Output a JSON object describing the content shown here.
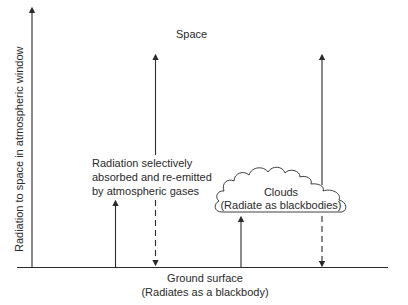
{
  "diagram": {
    "labels": {
      "space": "Space",
      "left_axis": "Radiation to space in atmospheric window",
      "gases_line1": "Radiation selectively",
      "gases_line2": "absorbed and re-emitted",
      "gases_line3": "by atmospheric gases",
      "clouds_line1": "Clouds",
      "clouds_line2": "(Radiate as blackbodies)",
      "ground_line1": "Ground surface",
      "ground_line2": "(Radiates as a blackbody)"
    },
    "colors": {
      "ink": "#2a2a2a",
      "background": "#ffffff"
    }
  }
}
